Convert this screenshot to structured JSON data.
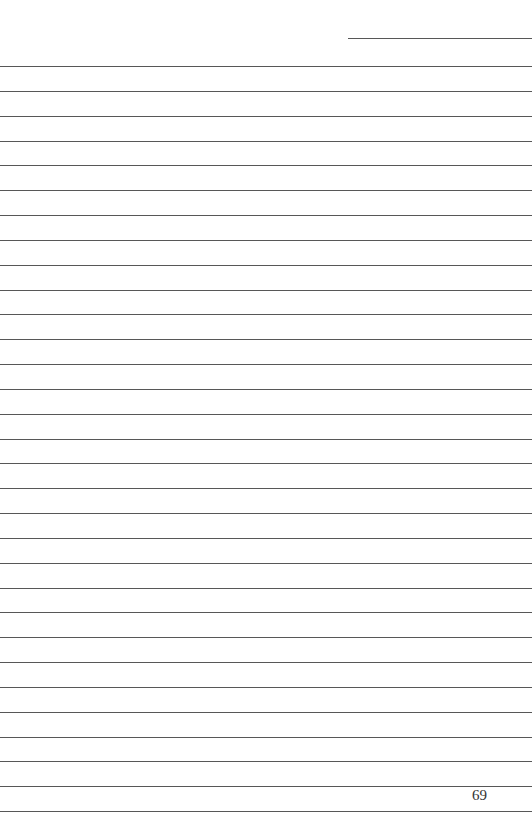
{
  "page": {
    "type": "lined-notebook-page",
    "page_number": "69",
    "line_color": "#3a3a3a",
    "background": "#ffffff",
    "header_line": {
      "x_start": 348,
      "x_end": 532,
      "y": 38
    },
    "ruled_lines": {
      "count": 31,
      "first_y": 66,
      "last_y": 811,
      "x_start": 0,
      "x_end": 532
    }
  }
}
